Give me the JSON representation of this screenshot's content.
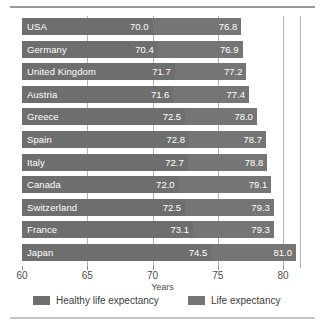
{
  "chart_data": {
    "type": "bar",
    "orientation": "horizontal",
    "title": "",
    "xlabel": "Years",
    "ylabel": "",
    "xlim": [
      60,
      80
    ],
    "xticks": [
      60,
      65,
      70,
      75,
      80
    ],
    "xtick_labels": [
      "60",
      "65",
      "70",
      "75",
      "80"
    ],
    "grid": true,
    "legend_position": "bottom",
    "categories": [
      "USA",
      "Germany",
      "United Kingdom",
      "Austria",
      "Greece",
      "Spain",
      "Italy",
      "Canada",
      "Switzerland",
      "France",
      "Japan"
    ],
    "series": [
      {
        "name": "Healthy life expectancy",
        "color": "#6e6e6e",
        "values": [
          70.0,
          70.4,
          71.7,
          71.6,
          72.5,
          72.8,
          72.7,
          72.0,
          72.5,
          73.1,
          74.5
        ],
        "value_labels": [
          "70.0",
          "70.4",
          "71.7",
          "71.6",
          "72.5",
          "72.8",
          "72.7",
          "72.0",
          "72.5",
          "73.1",
          "74.5"
        ]
      },
      {
        "name": "Life expectancy",
        "color": "#757575",
        "values": [
          76.8,
          76.9,
          77.2,
          77.4,
          78.0,
          78.7,
          78.8,
          79.1,
          79.3,
          79.3,
          81.0
        ],
        "value_labels": [
          "76.8",
          "76.9",
          "77.2",
          "77.4",
          "78.0",
          "78.7",
          "78.8",
          "79.1",
          "79.3",
          "79.3",
          "81.0"
        ]
      }
    ]
  },
  "axis": {
    "x_title": "Years",
    "tick_labels": [
      "60",
      "65",
      "70",
      "75",
      "80"
    ]
  },
  "legend": {
    "items": [
      {
        "label": "Healthy life expectancy",
        "color": "#6e6e6e"
      },
      {
        "label": "Life expectancy",
        "color": "#757575"
      }
    ]
  }
}
